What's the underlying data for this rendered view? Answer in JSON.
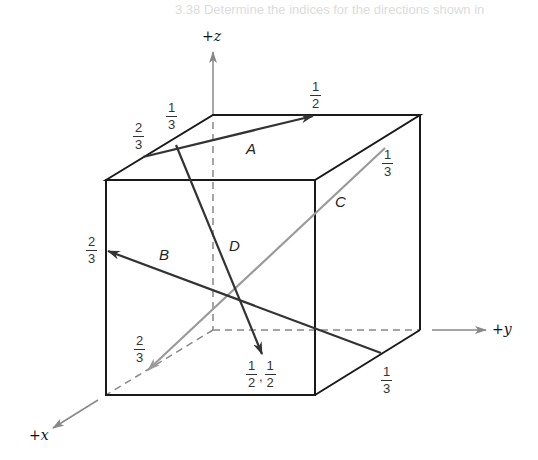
{
  "header": {
    "line1": "3.38 Determine the indices for the directions shown in",
    "line2": "the following cubic unit cell:"
  },
  "axes": {
    "z_label": "+z",
    "y_label": "+y",
    "x_label": "+x"
  },
  "vectors": [
    {
      "name": "A",
      "color": "#333333",
      "start_labels": [
        "2/3",
        "1/3"
      ],
      "end_label": "1/2"
    },
    {
      "name": "B",
      "color": "#333333",
      "start_label": "1/3",
      "end_label": "2/3"
    },
    {
      "name": "C",
      "color": "#9a9a9a",
      "start_label": "1/3",
      "end_label": "2/3"
    },
    {
      "name": "D",
      "color": "#333333",
      "start_label": "1/3",
      "end_label": "1/2, 1/2"
    }
  ],
  "fractions": {
    "a_start_x": {
      "num": "2",
      "den": "3"
    },
    "a_start_y": {
      "num": "1",
      "den": "3"
    },
    "a_end": {
      "num": "1",
      "den": "2"
    },
    "c_start": {
      "num": "1",
      "den": "3"
    },
    "b_end": {
      "num": "2",
      "den": "3"
    },
    "c_end": {
      "num": "2",
      "den": "3"
    },
    "d_end_1": {
      "num": "1",
      "den": "2"
    },
    "d_end_2": {
      "num": "1",
      "den": "2"
    },
    "b_start": {
      "num": "1",
      "den": "3"
    }
  },
  "colors": {
    "cube_edge": "#1a1a1a",
    "hidden_edge": "#888888",
    "axis": "#888888",
    "dark_vector": "#333333",
    "light_vector": "#9a9a9a"
  }
}
